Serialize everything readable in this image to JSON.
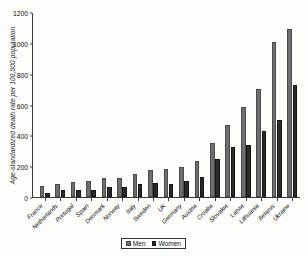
{
  "chart_data": {
    "type": "bar",
    "title": "",
    "xlabel": "",
    "ylabel": "Age-standardized death rate per 100,000 population",
    "ylim": [
      0,
      1200
    ],
    "yticks": [
      0,
      200,
      400,
      600,
      800,
      1000,
      1200
    ],
    "grid": false,
    "legend_position": "bottom-center",
    "categories": [
      "France",
      "Netherlands",
      "Portugal",
      "Spain",
      "Denmark",
      "Norway",
      "Italy",
      "Sweden",
      "UK",
      "Germany",
      "Austria",
      "Croatia",
      "Slovakia",
      "Latvia",
      "Lithuania",
      "Belarus",
      "Ukraine"
    ],
    "series": [
      {
        "name": "Men",
        "color": "#6e6e6e",
        "values": [
          70,
          88,
          98,
          103,
          125,
          125,
          148,
          175,
          180,
          193,
          233,
          350,
          470,
          590,
          703,
          1010,
          1095
        ]
      },
      {
        "name": "Women",
        "color": "#2a2a2a",
        "values": [
          28,
          45,
          48,
          45,
          65,
          65,
          85,
          93,
          88,
          103,
          133,
          248,
          325,
          338,
          433,
          505,
          730
        ]
      }
    ]
  },
  "legend": {
    "items": [
      {
        "label": "Men"
      },
      {
        "label": "Women"
      }
    ]
  }
}
